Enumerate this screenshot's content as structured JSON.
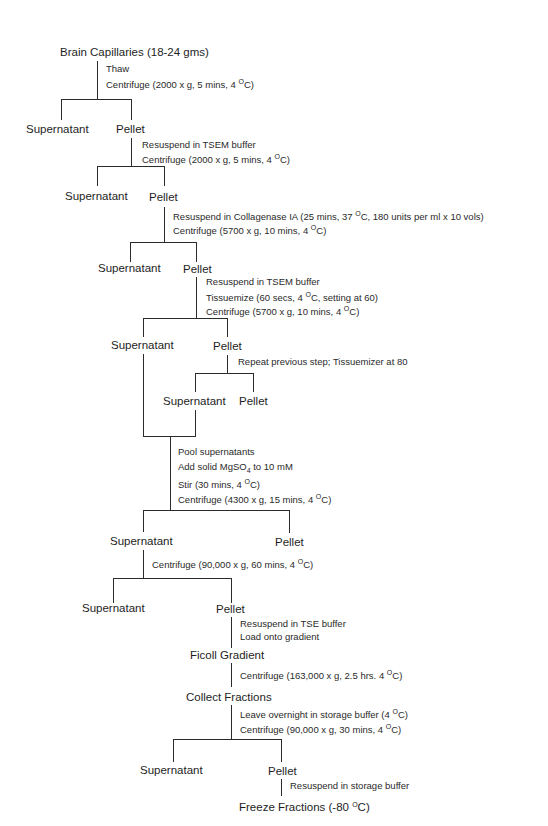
{
  "diagram": {
    "type": "flowchart",
    "title_node": "Brain Capillaries (18-24 gms)",
    "nodes": {
      "n1_sup": "Supernatant",
      "n1_pel": "Pellet",
      "n2_sup": "Supernatant",
      "n2_pel": "Pellet",
      "n3_sup": "Supernatant",
      "n3_pel": "Pellet",
      "n4_sup": "Supernatant",
      "n4_pel": "Pellet",
      "n5_sup": "Supernatant",
      "n5_pel": "Pellet",
      "n6_sup": "Supernatant",
      "n6_pel": "Pellet",
      "n7_sup": "Supernatant",
      "n7_pel": "Pellet",
      "ficoll": "Ficoll Gradient",
      "collect": "Collect Fractions",
      "n8_sup": "Supernatant",
      "n8_pel": "Pellet",
      "freeze_pre": "Freeze Fractions (-80 ",
      "freeze_post": "C)"
    },
    "steps": {
      "s1a": "Thaw",
      "s1b_pre": "Centrifuge (2000 x g, 5 mins, 4 ",
      "s1b_post": "C)",
      "s2a": "Resuspend in TSEM buffer",
      "s2b_pre": "Centrifuge (2000 x g, 5 mins, 4 ",
      "s2b_post": "C)",
      "s3a_pre": "Resuspend in Collagenase IA (25 mins, 37 ",
      "s3a_post": "C, 180 units per ml x 10 vols)",
      "s3b_pre": "Centrifuge (5700 x g, 10 mins, 4 ",
      "s3b_post": "C)",
      "s4a": "Resuspend in TSEM buffer",
      "s4b_pre": "Tissuemize (60 secs, 4 ",
      "s4b_post": "C, setting at 60)",
      "s4c_pre": "Centrifuge (5700 x g, 10 mins, 4 ",
      "s4c_post": "C)",
      "s5a": "Repeat previous step; Tissuemizer at 80",
      "s6a": "Pool supernatants",
      "s6b_pre": "Add solid MgSO",
      "s6b_sub": "4",
      "s6b_post": " to 10 mM",
      "s6c_pre": "Stir (30 mins, 4 ",
      "s6c_post": "C)",
      "s6d_pre": "Centrifuge (4300 x g, 15 mins, 4 ",
      "s6d_post": "C)",
      "s7a_pre": "Centrifuge (90,000 x g, 60 mins, 4 ",
      "s7a_post": "C)",
      "s8a": "Resuspend in TSE buffer",
      "s8b": "Load onto gradient",
      "s9a_pre": "Centrifuge (163,000 x g, 2.5 hrs. 4 ",
      "s9a_post": "C)",
      "s10a_pre": "Leave overnight in storage buffer (4 ",
      "s10a_post": "C)",
      "s10b_pre": "Centrifuge (90,000 x g, 30 mins, 4 ",
      "s10b_post": "C)",
      "s11a": "Resuspend in storage buffer"
    },
    "degree_symbol": "O",
    "line_color": "#2b2b2b",
    "text_color": "#222222"
  }
}
